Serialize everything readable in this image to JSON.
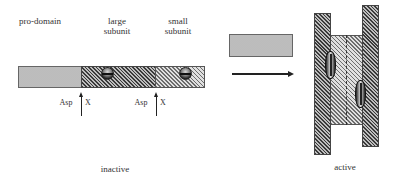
{
  "inactive": {
    "labels": {
      "pro_domain": "pro-domain",
      "large_subunit_line1": "large",
      "large_subunit_line2": "subunit",
      "small_subunit_line1": "small",
      "small_subunit_line2": "subunit"
    },
    "cleavage_sites": [
      {
        "residue": "Asp",
        "site": "X"
      },
      {
        "residue": "Asp",
        "site": "X"
      }
    ],
    "caption": "inactive"
  },
  "transition": {
    "released_block": "pro-domain",
    "arrow": "right-arrow"
  },
  "active": {
    "caption": "active"
  },
  "colors": {
    "background": "#ffffff",
    "dark_hatch": "#3a3a3a",
    "light_hatch": "#6d6d6d",
    "dotted_fill": "#d9d9d9"
  }
}
